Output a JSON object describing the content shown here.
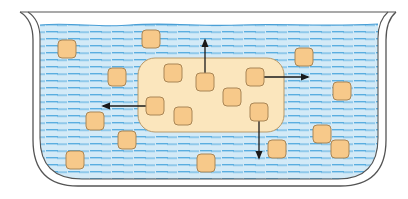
{
  "diagram": {
    "type": "diffusion-illustration",
    "colors": {
      "background": "#ffffff",
      "liquid": "#cfe8f6",
      "dash": "#5aaee0",
      "container_stroke": "#555555",
      "blob_fill": "#fbe6bd",
      "blob_stroke": "#b89a6a",
      "particle_fill": "#f7c98a",
      "particle_stroke": "#a98656",
      "arrow": "#1a1a1a"
    },
    "container": {
      "x": 30,
      "y": 12,
      "width": 356,
      "height": 176,
      "corner_radius": 40
    },
    "region": {
      "x": 138,
      "y": 58,
      "width": 146,
      "height": 74,
      "radius": 17
    },
    "particles_outside": [
      {
        "x": 58,
        "y": 40
      },
      {
        "x": 142,
        "y": 30
      },
      {
        "x": 108,
        "y": 68
      },
      {
        "x": 295,
        "y": 48
      },
      {
        "x": 333,
        "y": 82
      },
      {
        "x": 86,
        "y": 112
      },
      {
        "x": 118,
        "y": 131
      },
      {
        "x": 66,
        "y": 151
      },
      {
        "x": 197,
        "y": 154
      },
      {
        "x": 268,
        "y": 140
      },
      {
        "x": 313,
        "y": 125
      },
      {
        "x": 331,
        "y": 140
      }
    ],
    "particles_inside": [
      {
        "x": 164,
        "y": 64
      },
      {
        "x": 196,
        "y": 73
      },
      {
        "x": 246,
        "y": 68
      },
      {
        "x": 223,
        "y": 88
      },
      {
        "x": 146,
        "y": 97
      },
      {
        "x": 174,
        "y": 107
      },
      {
        "x": 250,
        "y": 103
      }
    ],
    "arrows": [
      {
        "direction": "up",
        "x1": 205,
        "y1": 73,
        "x2": 205,
        "y2": 40
      },
      {
        "direction": "right",
        "x1": 264,
        "y1": 77,
        "x2": 308,
        "y2": 77
      },
      {
        "direction": "left",
        "x1": 146,
        "y1": 106,
        "x2": 103,
        "y2": 106
      },
      {
        "direction": "down",
        "x1": 259,
        "y1": 121,
        "x2": 259,
        "y2": 158
      }
    ]
  }
}
